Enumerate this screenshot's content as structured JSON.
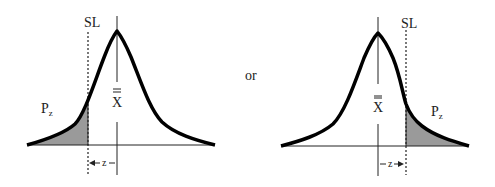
{
  "left_figure": {
    "spec_limit_label": "SL",
    "tail_area_label": "P",
    "tail_area_subscript": "z",
    "mean_label": "X",
    "distance_label": "z",
    "tail_side": "left"
  },
  "separator": "or",
  "right_figure": {
    "spec_limit_label": "SL",
    "tail_area_label": "P",
    "tail_area_subscript": "z",
    "mean_label": "X",
    "distance_label": "z",
    "tail_side": "right"
  },
  "colors": {
    "curve": "#000000",
    "shaded_tail": "#9a9a9a",
    "lines": "#222222"
  }
}
